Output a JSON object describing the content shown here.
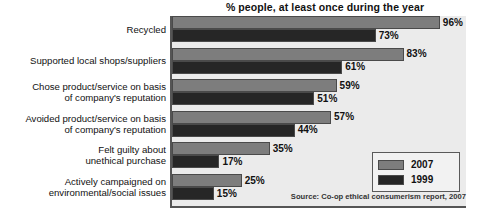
{
  "chart_data": {
    "type": "bar",
    "orientation": "horizontal",
    "title": "% people, at least once during the year",
    "xlabel": "",
    "ylabel": "",
    "xlim": [
      0,
      105
    ],
    "grid": false,
    "legend_position": "bottom-right",
    "categories": [
      "Recycled",
      "Supported local shops/suppliers",
      "Chose product/service on basis\nof company's reputation",
      "Avoided product/service on basis\nof company's reputation",
      "Felt guilty about\nunethical purchase",
      "Actively campaigned on\nenvironmental/social issues"
    ],
    "category_lines": [
      [
        "Recycled"
      ],
      [
        "Supported local shops/suppliers"
      ],
      [
        "Chose product/service on basis",
        "of company's reputation"
      ],
      [
        "Avoided product/service on basis",
        "of company's reputation"
      ],
      [
        "Felt guilty about",
        "unethical purchase"
      ],
      [
        "Actively campaigned on",
        "environmental/social issues"
      ]
    ],
    "series": [
      {
        "name": "2007",
        "color": "#7d7d7d",
        "values": [
          96,
          83,
          59,
          57,
          35,
          25
        ],
        "labels": [
          "96%",
          "83%",
          "59%",
          "57%",
          "35%",
          "25%"
        ]
      },
      {
        "name": "1999",
        "color": "#262626",
        "values": [
          73,
          61,
          51,
          44,
          17,
          15
        ],
        "labels": [
          "73%",
          "61%",
          "51%",
          "44%",
          "17%",
          "15%"
        ]
      }
    ],
    "annotations": {
      "source": "Source: Co-op ethical consumerism report, 2007"
    }
  },
  "legend": {
    "items": [
      {
        "label": "2007",
        "color": "#7d7d7d"
      },
      {
        "label": "1999",
        "color": "#262626"
      }
    ]
  }
}
